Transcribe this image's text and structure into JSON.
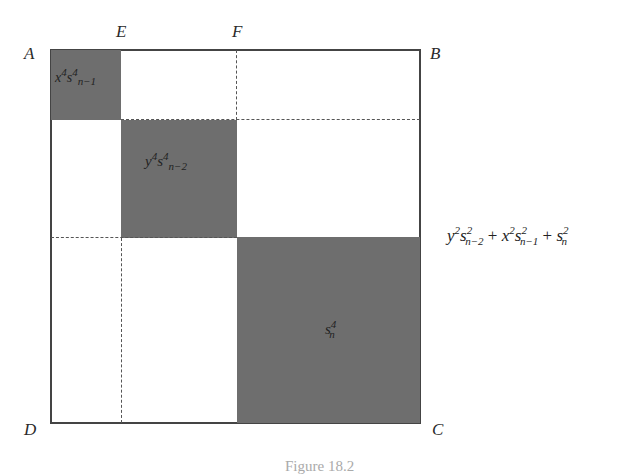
{
  "figure": {
    "corner_labels": {
      "A": "A",
      "B": "B",
      "C": "C",
      "D": "D",
      "E": "E",
      "F": "F"
    },
    "regions": [
      {
        "id": "top-left",
        "label_base": "x",
        "label_sup": "4",
        "label_base2": "s",
        "label_sup2": "4",
        "label_sub": "n−1",
        "fill": "#6e6e6e"
      },
      {
        "id": "middle",
        "label_base": "y",
        "label_sup": "4",
        "label_base2": "s",
        "label_sup2": "4",
        "label_sub": "n−2",
        "fill": "#6e6e6e"
      },
      {
        "id": "bottom-right",
        "label_base": "s",
        "label_sup": "4",
        "label_sub": "n",
        "fill": "#6e6e6e"
      }
    ],
    "side_expression": {
      "t1_base": "y",
      "t1_sup": "2",
      "t1_base2": "s",
      "t1_sup2": "2",
      "t1_sub": "n−2",
      "plus1": "+",
      "t2_base": "x",
      "t2_sup": "2",
      "t2_base2": "s",
      "t2_sup2": "2",
      "t2_sub": "n−1",
      "plus2": "+",
      "t3_base": "s",
      "t3_sup": "2",
      "t3_sub": "n"
    },
    "caption": "Figure 18.2"
  }
}
